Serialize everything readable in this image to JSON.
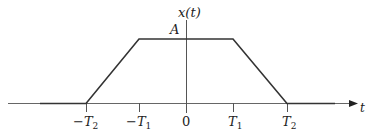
{
  "diagram": {
    "type": "piecewise-linear signal (trapezoid)",
    "y_axis_label": "x(t)",
    "x_axis_label": "t",
    "amplitude_label": "A",
    "ticks": [
      {
        "label_sign": "−",
        "label_main": "T",
        "label_sub": "2",
        "value": "-T2"
      },
      {
        "label_sign": "−",
        "label_main": "T",
        "label_sub": "1",
        "value": "-T1"
      },
      {
        "label_sign": "",
        "label_main": "0",
        "label_sub": "",
        "value": "0"
      },
      {
        "label_sign": "",
        "label_main": "T",
        "label_sub": "1",
        "value": "T1"
      },
      {
        "label_sign": "",
        "label_main": "T",
        "label_sub": "2",
        "value": "T2"
      }
    ],
    "signal_points": [
      {
        "t": "-inf",
        "x": "0"
      },
      {
        "t": "-T2",
        "x": "0"
      },
      {
        "t": "-T1",
        "x": "A"
      },
      {
        "t": "T1",
        "x": "A"
      },
      {
        "t": "T2",
        "x": "0"
      },
      {
        "t": "+inf",
        "x": "0"
      }
    ],
    "colors": {
      "line": "#333333",
      "axis": "#555555",
      "text": "#222222"
    }
  }
}
